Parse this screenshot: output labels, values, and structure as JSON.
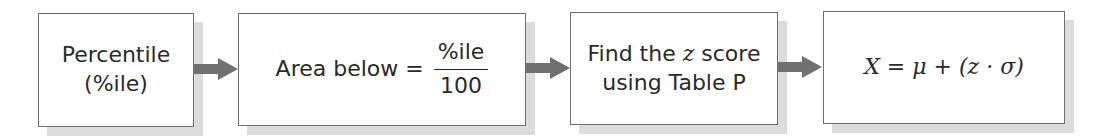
{
  "diagram": {
    "steps": [
      {
        "line1": "Percentile",
        "line2": "(%ile)"
      },
      {
        "lhs": "Area below =",
        "numerator": "%ile",
        "denominator": "100"
      },
      {
        "prefix": "Find the",
        "var": "z",
        "suffix": "score",
        "line2": "using Table P"
      },
      {
        "formula": "X = μ + (z · σ)"
      }
    ],
    "colors": {
      "border": "#6e6e6e",
      "shadow": "#dcdcdc",
      "arrow": "#707070"
    }
  }
}
